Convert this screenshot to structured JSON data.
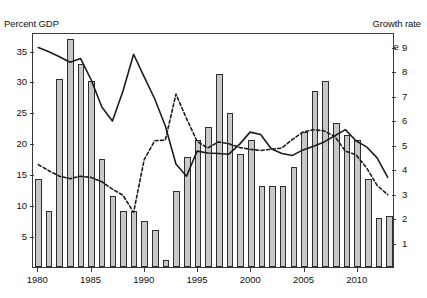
{
  "labels": {
    "left_axis_caption": "Percent GDP",
    "right_axis_caption": "Growth rate",
    "ghost_title": "",
    "annotation_investment": "Total investment",
    "annotation_savings": "Gross national savings",
    "legend_bars": "Real GDP growth rate",
    "legend_swatch_icon": "bar-swatch-icon"
  },
  "chart_data": {
    "type": "bar",
    "title": "",
    "xlabel": "",
    "ylabel": "Percent GDP",
    "y2label": "Growth rate",
    "grid": false,
    "legend_position": "top-right",
    "xlim": [
      1979,
      2014
    ],
    "ylim": [
      0,
      38
    ],
    "y2lim": [
      0,
      9.6
    ],
    "yticks": [
      5,
      10,
      15,
      20,
      25,
      30,
      35
    ],
    "y2ticks": [
      1,
      2,
      3,
      4,
      5,
      6,
      7,
      8,
      9
    ],
    "xticks": [
      1980,
      1985,
      1990,
      1995,
      2000,
      2005,
      2010
    ],
    "x": [
      1980,
      1981,
      1982,
      1983,
      1984,
      1985,
      1986,
      1987,
      1988,
      1989,
      1990,
      1991,
      1992,
      1993,
      1994,
      1995,
      1996,
      1997,
      1998,
      1999,
      2000,
      2001,
      2002,
      2003,
      2004,
      2005,
      2006,
      2007,
      2008,
      2009,
      2010,
      2011,
      2012,
      2013
    ],
    "series": [
      {
        "name": "Real GDP growth rate",
        "type": "bar",
        "axis": "right",
        "unit": "percent",
        "values": [
          3.6,
          2.3,
          7.7,
          9.3,
          8.3,
          7.6,
          4.4,
          2.9,
          2.3,
          2.3,
          1.9,
          1.5,
          0.3,
          3.1,
          4.5,
          5.2,
          5.7,
          7.9,
          6.3,
          4.6,
          5.2,
          3.3,
          3.3,
          3.3,
          4.1,
          5.5,
          7.2,
          7.6,
          5.9,
          5.4,
          5.2,
          3.6,
          2.0,
          2.1
        ]
      },
      {
        "name": "Total investment",
        "type": "line",
        "style": "solid",
        "axis": "left",
        "unit": "percent of GDP",
        "values": [
          35.8,
          35.1,
          34.3,
          33.4,
          34.0,
          30.5,
          26.1,
          23.8,
          28.7,
          34.7,
          31.0,
          27.4,
          23.0,
          16.8,
          14.8,
          18.9,
          18.6,
          18.5,
          18.4,
          20.0,
          22.0,
          21.6,
          19.3,
          18.5,
          18.2,
          19.1,
          19.7,
          20.4,
          21.4,
          22.4,
          20.6,
          19.6,
          17.8,
          14.6
        ]
      },
      {
        "name": "Gross national savings",
        "type": "line",
        "style": "dotted",
        "axis": "left",
        "unit": "percent of GDP",
        "values": [
          16.7,
          15.7,
          14.8,
          14.4,
          14.8,
          14.6,
          13.9,
          12.7,
          11.7,
          8.9,
          17.5,
          20.6,
          20.7,
          28.2,
          24.2,
          20.5,
          19.4,
          20.4,
          20.1,
          19.5,
          19.2,
          19.0,
          19.2,
          19.4,
          20.8,
          22.0,
          22.4,
          22.2,
          21.3,
          18.9,
          18.3,
          16.2,
          13.3,
          11.8
        ]
      }
    ]
  }
}
